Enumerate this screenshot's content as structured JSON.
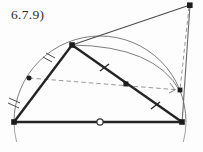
{
  "figure": {
    "label": "6.7.9)",
    "kind": "geometry-construction-diagram",
    "canvas": {
      "width": 203,
      "height": 152,
      "background": "#fdfdfd"
    },
    "colors": {
      "solid_stroke": "#2b2b2b",
      "thin_stroke": "#6a6a6a",
      "dashed_stroke": "#8a8a8a",
      "point_fill": "#1d1d1d",
      "open_point_fill": "#ffffff"
    },
    "points": {
      "base_left": {
        "x": 14,
        "y": 122,
        "marker": "filled-square"
      },
      "base_right": {
        "x": 182,
        "y": 122,
        "marker": "filled-square"
      },
      "center": {
        "x": 100,
        "y": 122,
        "marker": "open-circle"
      },
      "apex": {
        "x": 72,
        "y": 45,
        "marker": "filled-square"
      },
      "top_right": {
        "x": 190,
        "y": 5,
        "marker": "filled-square"
      },
      "arc_point": {
        "x": 29,
        "y": 78,
        "marker": "filled-dot"
      },
      "foot_right": {
        "x": 180,
        "y": 90,
        "marker": "filled-square"
      },
      "mid_hyp": {
        "x": 126,
        "y": 84,
        "marker": "filled-square"
      }
    },
    "segments": [
      {
        "name": "baseline",
        "from": "base_left",
        "to": "base_right",
        "style": "solid-thick"
      },
      {
        "name": "left-leg",
        "from": "base_left",
        "to": "apex",
        "style": "solid-thick"
      },
      {
        "name": "hypotenuse",
        "from": "apex",
        "to": "base_right",
        "style": "solid-thick"
      },
      {
        "name": "apex-to-topright",
        "from": "apex",
        "to": "top_right",
        "style": "solid-thin"
      },
      {
        "name": "right-vertical",
        "from": "top_right",
        "to": "base_right",
        "style": "solid-thin"
      },
      {
        "name": "chord-dashed",
        "from": "arc_point",
        "to": "foot_right",
        "style": "dashed"
      },
      {
        "name": "drop-dashed",
        "from": "top_right",
        "to": "foot_right",
        "style": "dashed"
      }
    ],
    "arcs": [
      {
        "name": "semicircle",
        "center": "center",
        "radius": 86,
        "style": "solid-thin"
      },
      {
        "name": "apex-arc",
        "from": "apex",
        "to": "foot_right",
        "style": "solid-thin"
      }
    ],
    "tick_marks": [
      {
        "name": "tick-arc-lower-left",
        "x": 14,
        "y": 101,
        "count": 2,
        "on": "semicircle"
      },
      {
        "name": "tick-arc-upper-left",
        "x": 48,
        "y": 58,
        "count": 2,
        "on": "semicircle"
      },
      {
        "name": "tick-hypotenuse-upper",
        "x": 104,
        "y": 67,
        "count": 1,
        "on": "hypotenuse"
      },
      {
        "name": "tick-hypotenuse-lower",
        "x": 155,
        "y": 105,
        "count": 1,
        "on": "hypotenuse"
      }
    ],
    "right_angle_marker": {
      "name": "right-angle-at-foot",
      "x": 180,
      "y": 90
    }
  }
}
